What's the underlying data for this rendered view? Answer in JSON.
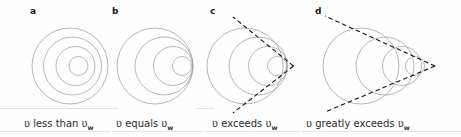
{
  "figure": {
    "title_visible": false,
    "background_color": "#fefefe",
    "wave_stroke_color": "#9a9a9a",
    "cone_stroke_color": "#111111",
    "rule_color": "#d8d8d8",
    "panels": [
      {
        "letter": "a",
        "caption_prefix": "ʋ less than ʋ",
        "caption_subscript": "w",
        "has_mach_cone": false,
        "circle_count": 4,
        "description": "concentric circles, source slower than wave speed"
      },
      {
        "letter": "b",
        "caption_prefix": "ʋ equals ʋ",
        "caption_subscript": "w",
        "has_mach_cone": false,
        "circle_count": 4,
        "description": "circles tangent at a common point, source at wave speed"
      },
      {
        "letter": "c",
        "caption_prefix": "ʋ exceeds ʋ",
        "caption_subscript": "w",
        "has_mach_cone": true,
        "circle_count": 4,
        "description": "circles with wide Mach cone, source faster than wave speed"
      },
      {
        "letter": "d",
        "caption_prefix": "ʋ greatly exceeds ʋ",
        "caption_subscript": "w",
        "has_mach_cone": true,
        "circle_count": 4,
        "description": "separated circles with narrow Mach cone"
      }
    ]
  },
  "chart_data": {
    "type": "diagram",
    "title": "",
    "series": [
      {
        "name": "panel-a-circles",
        "center_x": [
          70,
          72.5,
          75.5,
          78.5
        ],
        "center_y": [
          66,
          66,
          66,
          66
        ],
        "radius": [
          38,
          29,
          19.5,
          9.5
        ]
      },
      {
        "name": "panel-b-circles",
        "center_x": [
          155,
          164,
          173,
          182
        ],
        "center_y": [
          66,
          66,
          66,
          66
        ],
        "radius": [
          38,
          29,
          19.5,
          9.5
        ]
      },
      {
        "name": "panel-c-circles",
        "center_x": [
          245,
          258,
          268,
          277
        ],
        "center_y": [
          66,
          66,
          66,
          66
        ],
        "radius": [
          38,
          29,
          19.5,
          9.5
        ]
      },
      {
        "name": "panel-d-circles",
        "center_x": [
          361,
          385,
          402,
          415
        ],
        "center_y": [
          66,
          66,
          66,
          66
        ],
        "radius": [
          38,
          29,
          19.5,
          9.5
        ]
      }
    ],
    "annotations": [
      {
        "text": "a",
        "x": 30,
        "y": 13
      },
      {
        "text": "b",
        "x": 112,
        "y": 13
      },
      {
        "text": "c",
        "x": 210,
        "y": 13
      },
      {
        "text": "d",
        "x": 315,
        "y": 13
      },
      {
        "text": "ʋ less than ʋw",
        "x": 24,
        "y": 128
      },
      {
        "text": "ʋ equals ʋw",
        "x": 116,
        "y": 128
      },
      {
        "text": "ʋ exceeds ʋw",
        "x": 212,
        "y": 128
      },
      {
        "text": "ʋ greatly exceeds ʋw",
        "x": 306,
        "y": 128
      }
    ]
  }
}
